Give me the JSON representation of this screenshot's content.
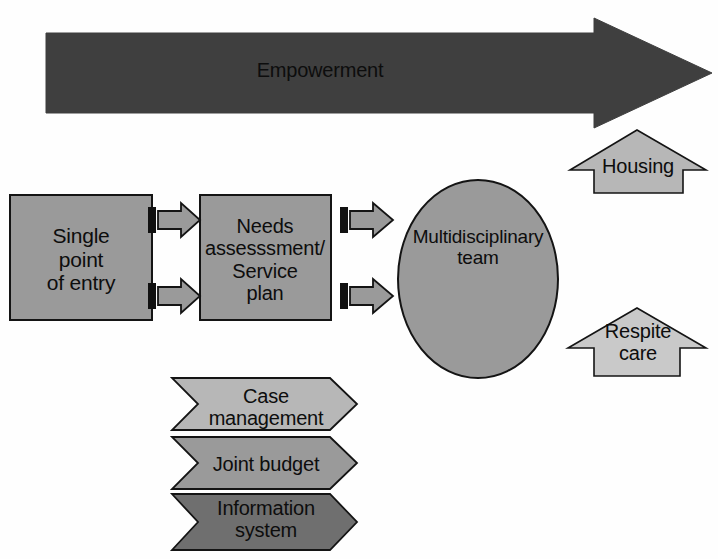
{
  "diagram": {
    "canvas": {
      "width": 718,
      "height": 559,
      "background": "#fefefe"
    },
    "palette": {
      "dark_gray": "#3f3f3f",
      "mid_dark_gray": "#6f6f6f",
      "mid_gray": "#9a9a9a",
      "light_gray": "#b7b7b7",
      "pale_gray": "#c9c9c9",
      "outline": "#0d0d0d",
      "text": "#0d0d0d",
      "white": "#ffffff"
    },
    "banner": {
      "name": "empowerment-arrow",
      "label": "Empowerment",
      "direction": "right",
      "fill": "#3f3f3f"
    },
    "process_boxes": [
      {
        "name": "single-point-of-entry",
        "label": "Single\npoint\nof entry",
        "fill": "#9a9a9a"
      },
      {
        "name": "needs-assessment",
        "label": "Needs\nassesssment/\nService\nplan",
        "fill": "#9a9a9a"
      }
    ],
    "ellipse": {
      "name": "multidisciplinary-team",
      "label": "Multidisciplinary\nteam",
      "fill": "#9a9a9a"
    },
    "connectors": [
      {
        "name": "connector-entry-to-needs-top",
        "from": "single-point-of-entry",
        "to": "needs-assessment"
      },
      {
        "name": "connector-entry-to-needs-bottom",
        "from": "single-point-of-entry",
        "to": "needs-assessment"
      },
      {
        "name": "connector-needs-to-team-top",
        "from": "needs-assessment",
        "to": "multidisciplinary-team"
      },
      {
        "name": "connector-needs-to-team-bottom",
        "from": "needs-assessment",
        "to": "multidisciplinary-team"
      }
    ],
    "support_arrows": [
      {
        "name": "housing-arrow",
        "label": "Housing",
        "direction": "up",
        "fill": "#b7b7b7"
      },
      {
        "name": "respite-care-arrow",
        "label": "Respite\ncare",
        "direction": "up",
        "fill": "#c9c9c9"
      }
    ],
    "enabler_chevrons": [
      {
        "name": "case-management-chevron",
        "label": "Case\nmanagement",
        "fill": "#b7b7b7"
      },
      {
        "name": "joint-budget-chevron",
        "label": "Joint budget",
        "fill": "#9a9a9a"
      },
      {
        "name": "information-system-chevron",
        "label": "Information\nsystem",
        "fill": "#6f6f6f"
      }
    ]
  }
}
